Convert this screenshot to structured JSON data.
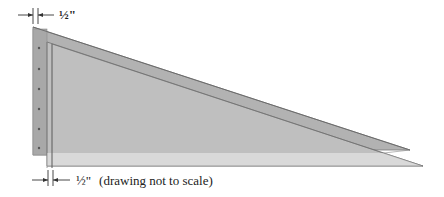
{
  "diagram": {
    "type": "technical-drawing",
    "top_dimension": {
      "value": "½\"",
      "description": "thickness of back plate"
    },
    "bottom_dimension": {
      "value": "½\"",
      "note": "(drawing not to scale)"
    },
    "colors": {
      "back_plate": "#a9a9a9",
      "back_triangle": "#b4b4b4",
      "front_sheet": "#bcbcbc",
      "bottom_strip": "#d9d9d9",
      "outline": "#6b6b6b",
      "dim_line": "#333333"
    },
    "screw_dots_count": 6
  }
}
